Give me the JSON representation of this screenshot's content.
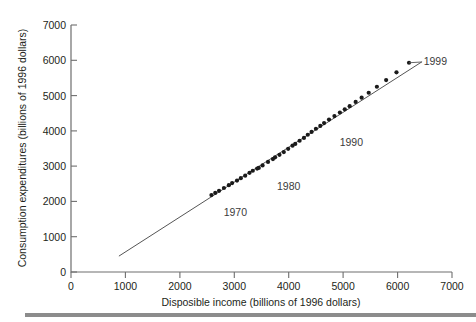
{
  "chart_data": {
    "type": "scatter",
    "title": "",
    "xlabel": "Disposible income (billions of 1996 dollars)",
    "ylabel": "Consumption expenditures (billions of 1996 dollars)",
    "xlim": [
      0,
      7000
    ],
    "ylim": [
      0,
      7000
    ],
    "xticks": [
      0,
      1000,
      2000,
      3000,
      4000,
      5000,
      6000,
      7000
    ],
    "yticks": [
      0,
      1000,
      2000,
      3000,
      4000,
      5000,
      6000,
      7000
    ],
    "xtick_labels": [
      "0",
      "1000",
      "2000",
      "3000",
      "4000",
      "5000",
      "6000",
      "7000"
    ],
    "ytick_labels": [
      "0",
      "1000",
      "2000",
      "3000",
      "4000",
      "5000",
      "6000",
      "7000"
    ],
    "grid": false,
    "legend": false,
    "marker_color": "#1a1a1a",
    "line_color": "#555555",
    "series": [
      {
        "name": "Consumption vs disposable income",
        "x": [
          2580,
          2650,
          2720,
          2810,
          2900,
          2960,
          3050,
          3120,
          3200,
          3280,
          3340,
          3420,
          3450,
          3520,
          3620,
          3710,
          3750,
          3830,
          3910,
          3990,
          4070,
          4120,
          4200,
          4280,
          4350,
          4420,
          4500,
          4580,
          4650,
          4740,
          4840,
          4940,
          5030,
          5120,
          5230,
          5340,
          5470,
          5620,
          5790,
          5980,
          6210
        ],
        "y": [
          2180,
          2240,
          2300,
          2380,
          2460,
          2520,
          2590,
          2660,
          2730,
          2810,
          2870,
          2930,
          2950,
          3020,
          3120,
          3200,
          3250,
          3320,
          3400,
          3490,
          3580,
          3630,
          3720,
          3800,
          3890,
          3970,
          4060,
          4140,
          4220,
          4320,
          4420,
          4520,
          4610,
          4700,
          4820,
          4940,
          5080,
          5250,
          5440,
          5660,
          5930
        ],
        "marker": "circle"
      }
    ],
    "fit_line": {
      "name": "fitted regression line",
      "x_start": 880,
      "y_start": 450,
      "x_end": 6450,
      "y_end": 5960
    },
    "annotations": [
      {
        "label": "1970",
        "x": 3020,
        "y": 1700,
        "leader": false
      },
      {
        "label": "1980",
        "x": 4000,
        "y": 2450,
        "leader": false
      },
      {
        "label": "1990",
        "x": 5150,
        "y": 3680,
        "leader": false
      },
      {
        "label": "1999",
        "x": 6480,
        "y": 5980,
        "leader": true,
        "leader_to_x": 6210,
        "leader_to_y": 5930
      }
    ]
  },
  "axis": {
    "x_title": "Disposible income (billions of 1996 dollars)",
    "y_title": "Consumption expenditures (billions of 1996 dollars)",
    "x_tick_0": "0",
    "x_tick_1": "1000",
    "x_tick_2": "2000",
    "x_tick_3": "3000",
    "x_tick_4": "4000",
    "x_tick_5": "5000",
    "x_tick_6": "6000",
    "x_tick_7": "7000",
    "y_tick_0": "0",
    "y_tick_1": "1000",
    "y_tick_2": "2000",
    "y_tick_3": "3000",
    "y_tick_4": "4000",
    "y_tick_5": "5000",
    "y_tick_6": "6000",
    "y_tick_7": "7000"
  },
  "annotations": {
    "a1970": "1970",
    "a1980": "1980",
    "a1990": "1990",
    "a1999": "1999"
  }
}
